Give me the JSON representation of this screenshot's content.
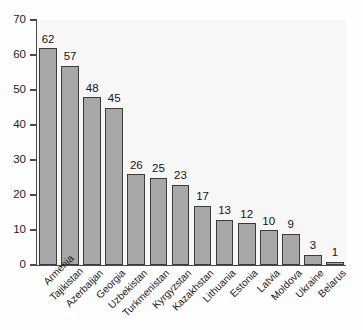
{
  "chart_data": {
    "type": "bar",
    "title": "",
    "subtitle": "",
    "xlabel": "",
    "ylabel": "",
    "ylim": [
      0,
      70
    ],
    "yticks": [
      0,
      10,
      20,
      30,
      40,
      50,
      60,
      70
    ],
    "grid": false,
    "legend": null,
    "bar_color": "#a8a8a8",
    "bar_edge_color": "#3c3c3c",
    "axis_color": "#4a4a4a",
    "plot_background": "#f7f7f7",
    "categories": [
      "Armenia",
      "Tajikistan",
      "Azerbaijan",
      "Georgia",
      "Uzbekistan",
      "Turkmenistan",
      "Kyrgyzstan",
      "Kazakhstan",
      "Lithuania",
      "Estonia",
      "Latvia",
      "Moldova",
      "Ukraine",
      "Belarus"
    ],
    "values": [
      62,
      57,
      48,
      45,
      26,
      25,
      23,
      17,
      13,
      12,
      10,
      9,
      3,
      1
    ],
    "value_labels": [
      "62",
      "57",
      "48",
      "45",
      "26",
      "25",
      "23",
      "17",
      "13",
      "12",
      "10",
      "9",
      "3",
      "1"
    ],
    "ytick_labels": [
      "0",
      "10",
      "20",
      "30",
      "40",
      "50",
      "60",
      "70"
    ]
  }
}
